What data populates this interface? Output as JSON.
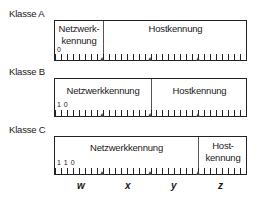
{
  "classes": [
    {
      "label": "Klasse A",
      "bits": "0",
      "network": "Netzwerk-\nkennung",
      "host": "Hostkennung",
      "divider_octet": 1
    },
    {
      "label": "Klasse B",
      "bits": "1 0",
      "network": "Netzwerkkennung",
      "host": "Hostkennung",
      "divider_octet": 2
    },
    {
      "label": "Klasse C",
      "bits": "1 1 0",
      "network": "Netzwerkkennung",
      "host": "Host-\nkennung",
      "divider_octet": 3
    }
  ],
  "octets": [
    "w",
    "x",
    "y",
    "z"
  ],
  "total_bits": 32
}
